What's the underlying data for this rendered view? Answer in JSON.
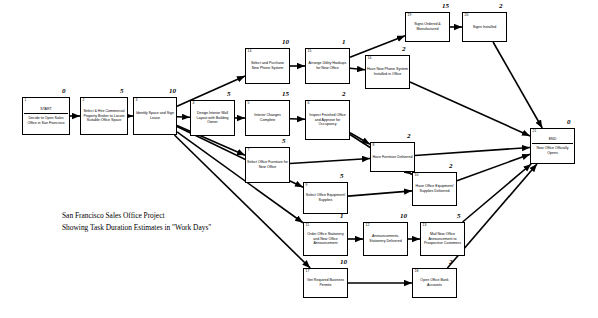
{
  "diagram": {
    "title_lines": [
      "San Francisco Sales Office Project",
      "Showing Task Duration Estimates in \"Work Days\""
    ],
    "caption_line1": "San Francisco Sales Office Project",
    "caption_line2": "Showing Task Duration Estimates in \"Work Days\"",
    "line_color": "#000000",
    "node_border_color": "#000000",
    "background": "#ffffff"
  },
  "nodes": [
    {
      "id": "1",
      "label": "START\n\nDecide to Open Sales Office in San Francisco",
      "label_top": "START",
      "label_body": "Decide to Open Sales Office in San Francisco",
      "duration": "0",
      "x": 22,
      "y": 97,
      "w": 48,
      "h": 38
    },
    {
      "id": "2",
      "label": "Select & Hire Commercial Property Broker to Locate Suitable Office Space",
      "duration": "5",
      "x": 80,
      "y": 97,
      "w": 48,
      "h": 38
    },
    {
      "id": "3",
      "label": "Identify Space and Sign Lease",
      "duration": "10",
      "x": 133,
      "y": 97,
      "w": 44,
      "h": 38
    },
    {
      "id": "4",
      "label": "Design Interior Wall Layout with Building Owner",
      "duration": "5",
      "x": 190,
      "y": 100,
      "w": 45,
      "h": 36
    },
    {
      "id": "5",
      "label": "Interior Changes Complete",
      "duration": "15",
      "x": 245,
      "y": 100,
      "w": 45,
      "h": 36
    },
    {
      "id": "6",
      "label": "Inspect Finished Office and Approve for Occupancy",
      "duration": "2",
      "x": 305,
      "y": 100,
      "w": 45,
      "h": 40
    },
    {
      "id": "7",
      "label": "Select Office Furniture for New Office",
      "duration": "5",
      "x": 245,
      "y": 147,
      "w": 45,
      "h": 36
    },
    {
      "id": "8",
      "label": "Have Furniture Delivered",
      "duration": "2",
      "x": 370,
      "y": 142,
      "w": 45,
      "h": 30
    },
    {
      "id": "9",
      "label": "Select Office Equipment/ Supplies",
      "duration": "5",
      "x": 303,
      "y": 182,
      "w": 45,
      "h": 32
    },
    {
      "id": "10",
      "label": "Have Office Equipment/ Supplies Delivered",
      "duration": "2",
      "x": 412,
      "y": 172,
      "w": 45,
      "h": 34
    },
    {
      "id": "11",
      "label": "Order Office Stationery and New Office Announcement",
      "duration": "1",
      "x": 303,
      "y": 222,
      "w": 45,
      "h": 34
    },
    {
      "id": "12",
      "label": "Announcements, Stationery Delivered",
      "duration": "10",
      "x": 363,
      "y": 222,
      "w": 45,
      "h": 34
    },
    {
      "id": "13",
      "label": "Mail New Office Announcement to Prospective Customers",
      "duration": "5",
      "x": 420,
      "y": 222,
      "w": 45,
      "h": 34
    },
    {
      "id": "14",
      "label": "Select and Purchase New Phone System",
      "duration": "10",
      "x": 245,
      "y": 48,
      "w": 45,
      "h": 36
    },
    {
      "id": "15",
      "label": "Arrange Utility Hookups for New Office",
      "duration": "1",
      "x": 305,
      "y": 48,
      "w": 45,
      "h": 36
    },
    {
      "id": "16",
      "label": "Have New Phone System Installed in Office",
      "duration": "2",
      "x": 365,
      "y": 55,
      "w": 45,
      "h": 34
    },
    {
      "id": "17",
      "label": "Get Required Business Permits",
      "duration": "10",
      "x": 303,
      "y": 268,
      "w": 45,
      "h": 30
    },
    {
      "id": "18",
      "label": "Open Office Bank Accounts",
      "duration": "2",
      "x": 412,
      "y": 268,
      "w": 45,
      "h": 30
    },
    {
      "id": "19",
      "label": "Signs Ordered & Manufactured",
      "duration": "15",
      "x": 405,
      "y": 12,
      "w": 45,
      "h": 30
    },
    {
      "id": "20",
      "label": "Signs Installed",
      "duration": "2",
      "x": 462,
      "y": 12,
      "w": 45,
      "h": 30
    },
    {
      "id": "21",
      "label": "END\n\nNew Office Officially Opens",
      "label_top": "END",
      "label_body": "New Office Officially Opens",
      "duration": "0",
      "x": 530,
      "y": 128,
      "w": 45,
      "h": 36
    }
  ],
  "edges": [
    {
      "from": "1",
      "to": "2"
    },
    {
      "from": "2",
      "to": "3"
    },
    {
      "from": "3",
      "to": "4"
    },
    {
      "from": "3",
      "to": "14"
    },
    {
      "from": "3",
      "to": "7"
    },
    {
      "from": "3",
      "to": "9"
    },
    {
      "from": "3",
      "to": "11"
    },
    {
      "from": "3",
      "to": "17"
    },
    {
      "from": "4",
      "to": "5"
    },
    {
      "from": "5",
      "to": "6"
    },
    {
      "from": "14",
      "to": "15"
    },
    {
      "from": "15",
      "to": "16"
    },
    {
      "from": "15",
      "to": "19"
    },
    {
      "from": "19",
      "to": "20"
    },
    {
      "from": "6",
      "to": "8"
    },
    {
      "from": "6",
      "to": "10"
    },
    {
      "from": "7",
      "to": "8"
    },
    {
      "from": "9",
      "to": "10"
    },
    {
      "from": "11",
      "to": "12"
    },
    {
      "from": "12",
      "to": "13"
    },
    {
      "from": "17",
      "to": "18"
    },
    {
      "from": "16",
      "to": "21"
    },
    {
      "from": "20",
      "to": "21"
    },
    {
      "from": "8",
      "to": "21"
    },
    {
      "from": "10",
      "to": "21"
    },
    {
      "from": "13",
      "to": "21"
    },
    {
      "from": "18",
      "to": "21"
    }
  ]
}
